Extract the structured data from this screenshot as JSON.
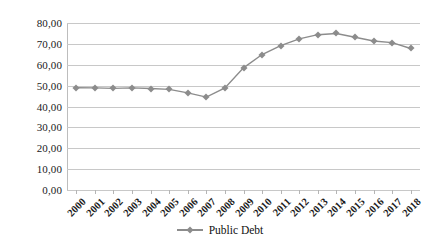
{
  "chart_data": {
    "type": "line",
    "title": "",
    "xlabel": "",
    "ylabel": "",
    "categories": [
      "2000",
      "2001",
      "2002",
      "2003",
      "2004",
      "2005",
      "2006",
      "2007",
      "2008",
      "2009",
      "2010",
      "2011",
      "2012",
      "2013",
      "2014",
      "2015",
      "2016",
      "2017",
      "2018"
    ],
    "series": [
      {
        "name": "Public Debt",
        "color": "#8c8c8c",
        "marker": "diamond",
        "values": [
          49.0,
          48.9,
          48.7,
          48.9,
          48.6,
          48.2,
          46.5,
          44.5,
          48.9,
          58.5,
          64.9,
          69.2,
          72.4,
          74.4,
          75.0,
          73.2,
          71.4,
          70.6,
          67.8
        ]
      }
    ],
    "ylim": [
      0,
      80
    ],
    "ytick_values": [
      0,
      10,
      20,
      30,
      40,
      50,
      60,
      70,
      80
    ],
    "ytick_labels": [
      "0,00",
      "10,00",
      "20,00",
      "30,00",
      "40,00",
      "50,00",
      "60,00",
      "70,00",
      "80,00"
    ],
    "grid": "horizontal",
    "legend_position": "bottom-center"
  },
  "legend": {
    "items": [
      {
        "label": "Public Debt"
      }
    ]
  }
}
